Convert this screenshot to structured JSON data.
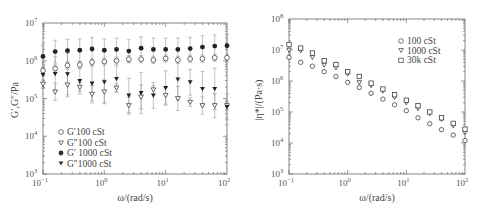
{
  "chart_data": [
    {
      "type": "scatter",
      "title": "",
      "xlabel": "ω/(rad/s)",
      "ylabel": "G′,G″/Pa",
      "xscale": "log",
      "yscale": "log",
      "xlim": [
        0.1,
        100
      ],
      "ylim": [
        1000,
        10000000
      ],
      "x_ticks": [
        "10^-1",
        "10^0",
        "10^1",
        "10^2"
      ],
      "y_ticks": [
        "10^3",
        "10^4",
        "10^5",
        "10^6",
        "10^7"
      ],
      "grid": false,
      "legend_position": "lower left",
      "x": [
        0.1,
        0.158,
        0.251,
        0.398,
        0.631,
        1.0,
        1.58,
        2.51,
        3.98,
        6.31,
        10.0,
        15.8,
        25.1,
        39.8,
        63.1,
        100.0
      ],
      "series": [
        {
          "name": "G′ 100 cSt",
          "marker": "open-circle",
          "values": [
            550000,
            620000,
            750000,
            780000,
            920000,
            950000,
            1000000,
            1100000,
            1100000,
            1050000,
            1150000,
            1050000,
            1120000,
            1130000,
            1200000,
            1200000
          ]
        },
        {
          "name": "G″ 100 cSt",
          "marker": "open-triangle-down",
          "values": [
            240000,
            150000,
            230000,
            200000,
            130000,
            150000,
            190000,
            65000,
            110000,
            170000,
            120000,
            100000,
            80000,
            65000,
            65000,
            65000
          ]
        },
        {
          "name": "G′ 1000 cSt",
          "marker": "filled-circle",
          "values": [
            1300000,
            1750000,
            1850000,
            1900000,
            2050000,
            1900000,
            2000000,
            1800000,
            2150000,
            2000000,
            2000000,
            2000000,
            2100000,
            2300000,
            2450000,
            2500000
          ]
        },
        {
          "name": "G″ 1000 cSt",
          "marker": "filled-triangle-down",
          "values": [
            420000,
            450000,
            440000,
            290000,
            250000,
            270000,
            330000,
            120000,
            140000,
            120000,
            190000,
            320000,
            270000,
            180000,
            180000,
            60000
          ]
        }
      ]
    },
    {
      "type": "scatter",
      "title": "",
      "xlabel": "ω/(rad/s)",
      "ylabel": "|η*|/(Pa·s)",
      "xscale": "log",
      "yscale": "log",
      "xlim": [
        0.1,
        100
      ],
      "ylim": [
        1000,
        100000000
      ],
      "x_ticks": [
        "10^-1",
        "10^0",
        "10^1",
        "10^2"
      ],
      "y_ticks": [
        "10^3",
        "10^4",
        "10^5",
        "10^6",
        "10^7",
        "10^8"
      ],
      "grid": false,
      "legend_position": "upper right",
      "x": [
        0.1,
        0.158,
        0.251,
        0.398,
        0.631,
        1.0,
        1.58,
        2.51,
        3.98,
        6.31,
        10.0,
        15.8,
        25.1,
        39.8,
        63.1,
        100.0
      ],
      "series": [
        {
          "name": "100 cSt",
          "marker": "open-circle",
          "values": [
            5800000,
            4000000,
            3000000,
            2000000,
            1400000,
            900000,
            620000,
            400000,
            260000,
            170000,
            110000,
            65000,
            42000,
            27000,
            18000,
            12000
          ]
        },
        {
          "name": "1000 cSt",
          "marker": "open-triangle-down",
          "values": [
            10000000,
            9500000,
            5800000,
            3300000,
            2700000,
            1700000,
            900000,
            720000,
            480000,
            300000,
            200000,
            130000,
            90000,
            58000,
            36000,
            22000
          ]
        },
        {
          "name": "30k cSt",
          "marker": "open-square",
          "values": [
            15000000,
            11500000,
            8000000,
            4500000,
            3400000,
            2000000,
            1400000,
            850000,
            550000,
            360000,
            240000,
            160000,
            100000,
            65000,
            43000,
            28000
          ]
        }
      ]
    }
  ],
  "left_chart": {
    "y_axis_title": "G′,G″/Pa",
    "x_axis_title": "ω/(rad/s)",
    "x_tick_labels": [
      {
        "base": "10",
        "exp": "−1"
      },
      {
        "base": "10",
        "exp": "0"
      },
      {
        "base": "10",
        "exp": "1"
      },
      {
        "base": "10",
        "exp": "2"
      }
    ],
    "y_tick_labels": [
      {
        "base": "10",
        "exp": "3"
      },
      {
        "base": "10",
        "exp": "4"
      },
      {
        "base": "10",
        "exp": "5"
      },
      {
        "base": "10",
        "exp": "6"
      },
      {
        "base": "10",
        "exp": "7"
      }
    ],
    "legend": [
      "G′100 cSt",
      "G″100 cSt",
      "G′ 1000 cSt",
      "G″1000 cSt"
    ]
  },
  "right_chart": {
    "y_axis_title": "|η*|/(Pa·s)",
    "x_axis_title": "ω/(rad/s)",
    "x_tick_labels": [
      {
        "base": "10",
        "exp": "−1"
      },
      {
        "base": "10",
        "exp": "0"
      },
      {
        "base": "10",
        "exp": "1"
      },
      {
        "base": "10",
        "exp": "2"
      }
    ],
    "y_tick_labels": [
      {
        "base": "10",
        "exp": "3"
      },
      {
        "base": "10",
        "exp": "4"
      },
      {
        "base": "10",
        "exp": "5"
      },
      {
        "base": "10",
        "exp": "6"
      },
      {
        "base": "10",
        "exp": "7"
      },
      {
        "base": "10",
        "exp": "8"
      }
    ],
    "legend": [
      "100 cSt",
      "1000 cSt",
      "30k cSt"
    ]
  },
  "colors": {
    "axis": "#555555",
    "marker": "#444444",
    "errorbar": "#999999",
    "text": "#444444"
  }
}
